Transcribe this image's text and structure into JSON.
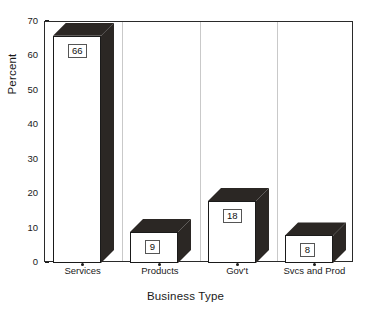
{
  "chart_data": {
    "type": "bar",
    "title": "",
    "xlabel": "Business Type",
    "ylabel": "Percent",
    "categories": [
      "Services",
      "Products",
      "Gov't",
      "Svcs and Prod"
    ],
    "values": [
      66,
      9,
      18,
      8
    ],
    "data_labels": [
      "66",
      "9",
      "18",
      "8"
    ],
    "ylim": [
      0,
      70
    ],
    "yticks": [
      0,
      10,
      20,
      30,
      40,
      50,
      60,
      70
    ],
    "ytick_labels": [
      "0",
      "10",
      "20",
      "30",
      "40",
      "50",
      "60",
      "70"
    ],
    "grid": "vertical-category-separators",
    "legend": "none",
    "style": "3d-extruded-bars",
    "colors": {
      "bar_front": "#ffffff",
      "bar_extrude": "#2b2724",
      "bar_outline": "#1a1a1a",
      "axis": "#2a2a2a",
      "gridline": "#c9c9c9",
      "text": "#1a1a1a",
      "background": "#ffffff"
    }
  },
  "axes": {
    "y_title": "Percent",
    "x_title": "Business Type"
  }
}
